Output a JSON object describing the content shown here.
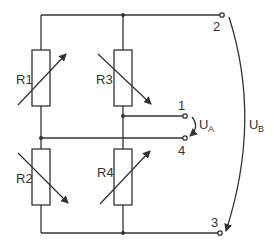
{
  "diagram": {
    "type": "wheatstone-bridge",
    "resistors": [
      {
        "id": "R1",
        "label": "R1",
        "position": "top-left",
        "variable_arrow": "up-right"
      },
      {
        "id": "R2",
        "label": "R2",
        "position": "bottom-left",
        "variable_arrow": "down-right"
      },
      {
        "id": "R3",
        "label": "R3",
        "position": "top-right",
        "variable_arrow": "down-right"
      },
      {
        "id": "R4",
        "label": "R4",
        "position": "bottom-right",
        "variable_arrow": "up-right"
      }
    ],
    "terminals": [
      {
        "id": "t1",
        "label": "1"
      },
      {
        "id": "t2",
        "label": "2"
      },
      {
        "id": "t3",
        "label": "3"
      },
      {
        "id": "t4",
        "label": "4"
      }
    ],
    "voltages": [
      {
        "id": "UA",
        "main": "U",
        "sub": "A",
        "between": [
          "1",
          "4"
        ]
      },
      {
        "id": "UB",
        "main": "U",
        "sub": "B",
        "between": [
          "2",
          "3"
        ]
      }
    ]
  }
}
